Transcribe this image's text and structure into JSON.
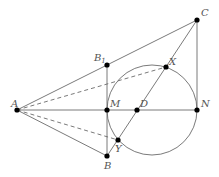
{
  "diagram": {
    "type": "geometry",
    "stroke_color": "#6b6b6b",
    "point_color": "#000000",
    "label_color": "#555555",
    "points": {
      "A": {
        "x": 17,
        "y": 110,
        "label": "A"
      },
      "B1": {
        "x": 107,
        "y": 65,
        "label": "B",
        "sub": "1"
      },
      "C": {
        "x": 197,
        "y": 20,
        "label": "C"
      },
      "M": {
        "x": 107,
        "y": 110,
        "label": "M"
      },
      "D": {
        "x": 137,
        "y": 110,
        "label": "D"
      },
      "N": {
        "x": 197,
        "y": 110,
        "label": "N"
      },
      "X": {
        "x": 166,
        "y": 67,
        "label": "X"
      },
      "Y": {
        "x": 118,
        "y": 140,
        "label": "Y"
      },
      "B": {
        "x": 107,
        "y": 156,
        "label": "B"
      }
    },
    "circle": {
      "cx": 152,
      "cy": 110,
      "r": 45
    },
    "solid_segments": [
      [
        "A",
        "C"
      ],
      [
        "A",
        "N"
      ],
      [
        "A",
        "B"
      ],
      [
        "C",
        "N"
      ],
      [
        "C",
        "B"
      ],
      [
        "B1",
        "B"
      ]
    ],
    "dashed_segments": [
      [
        "A",
        "X"
      ],
      [
        "A",
        "Y"
      ]
    ]
  }
}
